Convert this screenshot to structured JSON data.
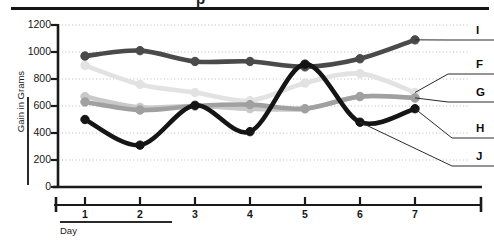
{
  "figure": {
    "clipped_glyph_above_rule": "p",
    "top_rule_present": true
  },
  "chart_data": {
    "type": "line",
    "title": "",
    "subtitle": "",
    "xlabel": "Day",
    "ylabel": "Gain in Grams",
    "x": [
      1,
      2,
      3,
      4,
      5,
      6,
      7
    ],
    "categories": [
      "1",
      "2",
      "3",
      "4",
      "5",
      "6",
      "7"
    ],
    "xtick_labels": [
      "1",
      "2",
      "3",
      "4",
      "5",
      "6",
      "7"
    ],
    "ytick_labels": [
      "0",
      "200",
      "400",
      "600",
      "800",
      "1000",
      "1200"
    ],
    "yticks": [
      0,
      200,
      400,
      600,
      800,
      1000,
      1200
    ],
    "ylim": [
      0,
      1200
    ],
    "xlim": [
      0.6,
      7.5
    ],
    "grid": "horizontal-dotted",
    "legend_position": "right-outside-leader-lines",
    "markers": "filled-circles",
    "series": [
      {
        "name": "I",
        "label": "I",
        "color": "#4a4a4a",
        "width": 4.6,
        "values": [
          970,
          1010,
          930,
          930,
          890,
          950,
          1090
        ]
      },
      {
        "name": "F",
        "label": "F",
        "color": "#e2e2e2",
        "width": 4.6,
        "values": [
          900,
          760,
          700,
          640,
          770,
          840,
          700
        ]
      },
      {
        "name": "G",
        "label": "G",
        "color": "#c9c9c9",
        "width": 4.6,
        "values": [
          670,
          590,
          600,
          580,
          580,
          670,
          660
        ]
      },
      {
        "name": "H",
        "label": "H",
        "color": "#a0a0a0",
        "width": 4.6,
        "values": [
          630,
          570,
          600,
          610,
          580,
          670,
          660
        ]
      },
      {
        "name": "J",
        "label": "J",
        "color": "#151515",
        "width": 4.6,
        "values": [
          500,
          310,
          605,
          410,
          910,
          480,
          580
        ]
      }
    ],
    "legend_entries": [
      {
        "label": "I",
        "color": "#4a4a4a"
      },
      {
        "label": "F",
        "color": "#e2e2e2"
      },
      {
        "label": "G",
        "color": "#c9c9c9"
      },
      {
        "label": "H",
        "color": "#a0a0a0"
      },
      {
        "label": "J",
        "color": "#151515"
      }
    ]
  }
}
